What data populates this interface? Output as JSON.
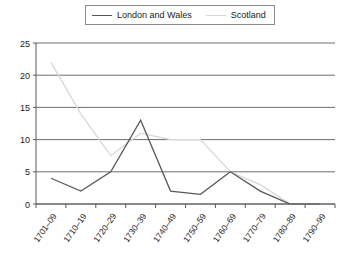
{
  "legend": {
    "position": "top-center",
    "entries": [
      {
        "label": "London and Wales",
        "color": "#595959",
        "swatch": "line-swatch-dark"
      },
      {
        "label": "Scotland",
        "color": "#d8d8d8",
        "swatch": "line-swatch-light"
      }
    ]
  },
  "chart_data": {
    "type": "line",
    "title": "",
    "subtitle": "",
    "xlabel": "",
    "ylabel": "",
    "categories": [
      "1701–09",
      "1710–19",
      "1720–29",
      "1730–39",
      "1740–49",
      "1750–59",
      "1760–69",
      "1770–79",
      "1780–89",
      "1790–99"
    ],
    "series": [
      {
        "name": "London and Wales",
        "color": "#595959",
        "values": [
          4,
          2,
          5,
          13,
          2,
          1.5,
          5,
          2,
          0,
          0
        ]
      },
      {
        "name": "Scotland",
        "color": "#d8d8d8",
        "values": [
          22,
          14,
          7.5,
          11,
          10,
          10,
          5,
          3,
          0,
          0
        ]
      }
    ],
    "ylim": [
      0,
      25
    ],
    "yticks": [
      0,
      5,
      10,
      15,
      20,
      25
    ],
    "ytick_labels": [
      "0",
      "5",
      "10",
      "15",
      "20",
      "25"
    ],
    "grid": {
      "horizontal": true,
      "vertical": false
    },
    "legend_position": "top-center"
  },
  "axes": {
    "y_tick_labels": [
      "25",
      "20",
      "15",
      "10",
      "5",
      "0"
    ],
    "x_tick_labels": [
      "1701–09",
      "1710–19",
      "1720–29",
      "1730–39",
      "1740–49",
      "1750–59",
      "1760–69",
      "1770–79",
      "1780–89",
      "1790–99"
    ]
  }
}
